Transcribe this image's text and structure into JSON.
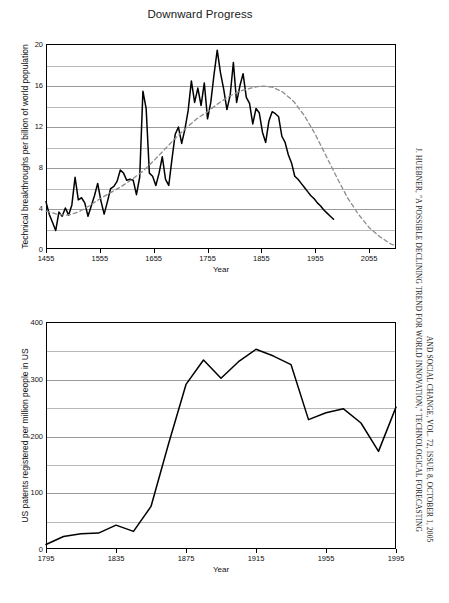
{
  "figure": {
    "title": "Downward Progress",
    "citation_line1": "J. HUEBNER, \"A POSSIBLE DECLINING TREND FOR WORLD INNOVATION,\" TECHNOLOGICAL FORECASTING",
    "citation_line2": "AND SOCIAL CHANGE, VOL. 72, ISSUE 8, OCTOBER 1, 2005"
  },
  "chart_data": [
    {
      "id": "innovation",
      "type": "line",
      "title": "Downward Progress",
      "xlabel": "Year",
      "ylabel": "Technical breakthroughs per billion of world population",
      "xlim": [
        1455,
        2105
      ],
      "ylim": [
        0,
        20
      ],
      "xticks": [
        1455,
        1555,
        1655,
        1755,
        1855,
        1955,
        2055
      ],
      "yticks": [
        0,
        4,
        8,
        12,
        16,
        20
      ],
      "yminor": [
        2,
        6,
        10,
        14,
        18
      ],
      "grid": true,
      "legend": "none",
      "series": [
        {
          "name": "Technical breakthroughs per billion of world population",
          "style": "solid",
          "color": "#000000",
          "x": [
            1455,
            1461,
            1467,
            1473,
            1479,
            1485,
            1491,
            1497,
            1503,
            1509,
            1515,
            1521,
            1527,
            1533,
            1539,
            1545,
            1551,
            1557,
            1563,
            1569,
            1575,
            1581,
            1587,
            1593,
            1599,
            1605,
            1611,
            1617,
            1623,
            1629,
            1635,
            1641,
            1647,
            1653,
            1659,
            1665,
            1671,
            1677,
            1683,
            1689,
            1695,
            1701,
            1707,
            1713,
            1719,
            1725,
            1731,
            1737,
            1743,
            1749,
            1755,
            1761,
            1767,
            1773,
            1779,
            1785,
            1791,
            1797,
            1803,
            1809,
            1815,
            1821,
            1827,
            1833,
            1839,
            1845,
            1851,
            1857,
            1863,
            1869,
            1875,
            1881,
            1887,
            1893,
            1899,
            1905,
            1911,
            1917,
            1923,
            1929,
            1935,
            1941,
            1947,
            1953,
            1959,
            1965,
            1971,
            1977,
            1983,
            1989
          ],
          "y": [
            4.6,
            3.4,
            2.6,
            1.8,
            3.6,
            3.2,
            4.0,
            3.3,
            4.3,
            7.0,
            4.8,
            5.0,
            4.5,
            3.2,
            4.2,
            5.2,
            6.4,
            4.7,
            3.4,
            4.6,
            5.9,
            6.1,
            6.6,
            7.7,
            7.4,
            6.7,
            6.8,
            6.7,
            5.3,
            7.0,
            15.4,
            13.7,
            7.4,
            7.1,
            6.2,
            7.4,
            9.0,
            6.8,
            6.2,
            8.8,
            11.2,
            11.9,
            10.3,
            11.7,
            13.5,
            16.4,
            14.3,
            15.7,
            14.0,
            16.2,
            12.7,
            14.3,
            17.0,
            19.4,
            17.2,
            15.6,
            13.6,
            15.0,
            18.2,
            14.3,
            15.9,
            17.1,
            14.8,
            14.2,
            12.2,
            13.7,
            13.3,
            11.4,
            10.4,
            12.5,
            13.4,
            13.2,
            12.9,
            11.0,
            10.4,
            9.2,
            8.4,
            7.1,
            6.8,
            6.4,
            6.0,
            5.6,
            5.2,
            4.9,
            4.5,
            4.2,
            3.8,
            3.5,
            3.2,
            2.9
          ]
        },
        {
          "name": "Fitted trend",
          "style": "dashed",
          "color": "#8c8c8c",
          "x": [
            1455,
            1475,
            1495,
            1515,
            1535,
            1555,
            1575,
            1595,
            1615,
            1635,
            1655,
            1675,
            1695,
            1715,
            1735,
            1755,
            1775,
            1795,
            1815,
            1835,
            1855,
            1875,
            1895,
            1915,
            1935,
            1955,
            1975,
            1995,
            2015,
            2035,
            2055,
            2075,
            2095,
            2105
          ],
          "y": [
            3.7,
            3.4,
            3.3,
            3.6,
            4.2,
            4.9,
            5.5,
            6.1,
            6.8,
            7.6,
            8.6,
            9.7,
            10.8,
            11.8,
            12.7,
            13.4,
            14.2,
            14.9,
            15.4,
            15.7,
            15.9,
            15.8,
            15.3,
            14.4,
            13.0,
            11.2,
            9.1,
            7.0,
            5.0,
            3.4,
            2.1,
            1.2,
            0.5,
            0.3
          ]
        }
      ]
    },
    {
      "id": "us-patents",
      "type": "line",
      "title": "",
      "xlabel": "Year",
      "ylabel": "US patents registered per million people in US",
      "xlim": [
        1795,
        1995
      ],
      "ylim": [
        0,
        400
      ],
      "xticks": [
        1795,
        1835,
        1875,
        1915,
        1955,
        1995
      ],
      "yticks": [
        0,
        100,
        200,
        300,
        400
      ],
      "yminor": [
        50,
        150,
        250,
        350
      ],
      "grid": true,
      "legend": "none",
      "series": [
        {
          "name": "US patents registered per million people in US",
          "style": "solid",
          "color": "#000000",
          "x": [
            1795,
            1805,
            1815,
            1825,
            1835,
            1845,
            1855,
            1865,
            1875,
            1885,
            1895,
            1905,
            1915,
            1925,
            1935,
            1945,
            1955,
            1965,
            1975,
            1985,
            1995
          ],
          "y": [
            8,
            22,
            27,
            28,
            42,
            31,
            75,
            185,
            290,
            333,
            301,
            330,
            352,
            340,
            325,
            228,
            240,
            247,
            222,
            172,
            250
          ]
        }
      ]
    }
  ]
}
